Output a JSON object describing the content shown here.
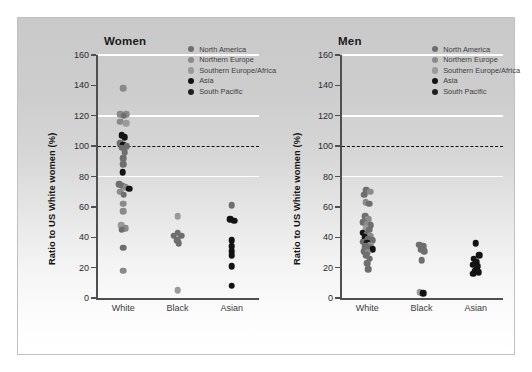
{
  "figure": {
    "background_top": "#c9c9c9",
    "background_bottom": "#ffffff",
    "border_color": "#c0c0c0"
  },
  "legend": {
    "position": "top-right-inside",
    "entries": [
      {
        "label": "North America",
        "color": "#6e6e6e"
      },
      {
        "label": "Northern Europe",
        "color": "#8a8a8a"
      },
      {
        "label": "Southern Europe/Africa",
        "color": "#9a9a9a"
      },
      {
        "label": "Asia",
        "color": "#131313"
      },
      {
        "label": "South Pacific",
        "color": "#1f1f1f"
      }
    ]
  },
  "axis": {
    "ylabel": "Ratio to US White women (%)",
    "yticks": [
      0,
      20,
      40,
      60,
      80,
      100,
      120,
      140,
      160
    ],
    "ylim": [
      0,
      160
    ],
    "gridlines": [
      80,
      120,
      160
    ],
    "reference_line": 100,
    "categories": [
      "White",
      "Black",
      "Asian"
    ]
  },
  "chart_data": {
    "type": "scatter",
    "title": "",
    "xlabel": "",
    "ylabel": "Ratio to US White women (%)",
    "ylim": [
      0,
      160
    ],
    "yticks": [
      0,
      20,
      40,
      60,
      80,
      100,
      120,
      140,
      160
    ],
    "grid": true,
    "gridlines_at": [
      80,
      120,
      160
    ],
    "reference_line": 100,
    "legend_position": "upper right",
    "categories": [
      "White",
      "Black",
      "Asian"
    ],
    "series": [
      {
        "name": "North America",
        "color": "#6e6e6e"
      },
      {
        "name": "Northern Europe",
        "color": "#8a8a8a"
      },
      {
        "name": "Southern Europe/Africa",
        "color": "#9a9a9a"
      },
      {
        "name": "Asia",
        "color": "#131313"
      },
      {
        "name": "South Pacific",
        "color": "#1f1f1f"
      }
    ],
    "panels": [
      {
        "title": "Women",
        "points": [
          {
            "category": "White",
            "value": 138,
            "offset": 0,
            "group": "Northern Europe"
          },
          {
            "category": "White",
            "value": 121,
            "offset": -0.3,
            "group": "Northern Europe"
          },
          {
            "category": "White",
            "value": 121,
            "offset": 0.3,
            "group": "Northern Europe"
          },
          {
            "category": "White",
            "value": 120,
            "offset": 0.04,
            "group": "North America"
          },
          {
            "category": "White",
            "value": 116,
            "offset": -0.26,
            "group": "Northern Europe"
          },
          {
            "category": "White",
            "value": 115,
            "offset": 0.26,
            "group": "Southern Europe/Africa"
          },
          {
            "category": "White",
            "value": 107,
            "offset": -0.12,
            "group": "Asia"
          },
          {
            "category": "White",
            "value": 106,
            "offset": 0.16,
            "group": "Asia"
          },
          {
            "category": "White",
            "value": 102,
            "offset": -0.3,
            "group": "North America"
          },
          {
            "category": "White",
            "value": 101,
            "offset": 0.02,
            "group": "Asia"
          },
          {
            "category": "White",
            "value": 100,
            "offset": 0.32,
            "group": "North America"
          },
          {
            "category": "White",
            "value": 99,
            "offset": -0.14,
            "group": "North America"
          },
          {
            "category": "White",
            "value": 96,
            "offset": 0.14,
            "group": "North America"
          },
          {
            "category": "White",
            "value": 92,
            "offset": 0.0,
            "group": "North America"
          },
          {
            "category": "White",
            "value": 88,
            "offset": 0.0,
            "group": "North America"
          },
          {
            "category": "White",
            "value": 83,
            "offset": -0.04,
            "group": "Asia"
          },
          {
            "category": "White",
            "value": 75,
            "offset": -0.34,
            "group": "North America"
          },
          {
            "category": "White",
            "value": 74,
            "offset": -0.08,
            "group": "North America"
          },
          {
            "category": "White",
            "value": 73,
            "offset": 0.22,
            "group": "Northern Europe"
          },
          {
            "category": "White",
            "value": 72,
            "offset": 0.56,
            "group": "Asia"
          },
          {
            "category": "White",
            "value": 70,
            "offset": -0.3,
            "group": "Northern Europe"
          },
          {
            "category": "White",
            "value": 68,
            "offset": 0.06,
            "group": "North America"
          },
          {
            "category": "White",
            "value": 62,
            "offset": 0.0,
            "group": "Northern Europe"
          },
          {
            "category": "White",
            "value": 57,
            "offset": 0.0,
            "group": "Northern Europe"
          },
          {
            "category": "White",
            "value": 48,
            "offset": -0.16,
            "group": "Southern Europe/Africa"
          },
          {
            "category": "White",
            "value": 46,
            "offset": 0.2,
            "group": "Northern Europe"
          },
          {
            "category": "White",
            "value": 45,
            "offset": -0.12,
            "group": "North America"
          },
          {
            "category": "White",
            "value": 33,
            "offset": 0.0,
            "group": "North America"
          },
          {
            "category": "White",
            "value": 18,
            "offset": 0.0,
            "group": "Northern Europe"
          },
          {
            "category": "Black",
            "value": 54,
            "offset": 0.0,
            "group": "Southern Europe/Africa"
          },
          {
            "category": "Black",
            "value": 43,
            "offset": 0.0,
            "group": "North America"
          },
          {
            "category": "Black",
            "value": 41,
            "offset": -0.34,
            "group": "North America"
          },
          {
            "category": "Black",
            "value": 41,
            "offset": 0.32,
            "group": "North America"
          },
          {
            "category": "Black",
            "value": 38,
            "offset": -0.02,
            "group": "North America"
          },
          {
            "category": "Black",
            "value": 36,
            "offset": 0.1,
            "group": "North America"
          },
          {
            "category": "Black",
            "value": 5,
            "offset": 0.0,
            "group": "Southern Europe/Africa"
          },
          {
            "category": "Asian",
            "value": 61,
            "offset": 0.0,
            "group": "North America"
          },
          {
            "category": "Asian",
            "value": 52,
            "offset": -0.16,
            "group": "Asia"
          },
          {
            "category": "Asian",
            "value": 51,
            "offset": 0.22,
            "group": "Asia"
          },
          {
            "category": "Asian",
            "value": 38,
            "offset": 0.0,
            "group": "Asia"
          },
          {
            "category": "Asian",
            "value": 34,
            "offset": 0.0,
            "group": "Asia"
          },
          {
            "category": "Asian",
            "value": 31,
            "offset": 0.0,
            "group": "Asia"
          },
          {
            "category": "Asian",
            "value": 28,
            "offset": 0.0,
            "group": "Asia"
          },
          {
            "category": "Asian",
            "value": 21,
            "offset": 0.0,
            "group": "Asia"
          },
          {
            "category": "Asian",
            "value": 8,
            "offset": 0.0,
            "group": "Asia"
          }
        ]
      },
      {
        "title": "Men",
        "points": [
          {
            "category": "White",
            "value": 71,
            "offset": -0.1,
            "group": "North America"
          },
          {
            "category": "White",
            "value": 70,
            "offset": 0.26,
            "group": "Northern Europe"
          },
          {
            "category": "White",
            "value": 68,
            "offset": -0.3,
            "group": "North America"
          },
          {
            "category": "White",
            "value": 63,
            "offset": -0.12,
            "group": "Northern Europe"
          },
          {
            "category": "White",
            "value": 62,
            "offset": 0.2,
            "group": "North America"
          },
          {
            "category": "White",
            "value": 54,
            "offset": -0.2,
            "group": "North America"
          },
          {
            "category": "White",
            "value": 52,
            "offset": 0.12,
            "group": "Northern Europe"
          },
          {
            "category": "White",
            "value": 50,
            "offset": -0.34,
            "group": "North America"
          },
          {
            "category": "White",
            "value": 49,
            "offset": 0.02,
            "group": "Northern Europe"
          },
          {
            "category": "White",
            "value": 48,
            "offset": 0.34,
            "group": "North America"
          },
          {
            "category": "White",
            "value": 46,
            "offset": -0.14,
            "group": "Southern Europe/Africa"
          },
          {
            "category": "White",
            "value": 45,
            "offset": 0.18,
            "group": "North America"
          },
          {
            "category": "White",
            "value": 43,
            "offset": -0.4,
            "group": "Asia"
          },
          {
            "category": "White",
            "value": 42,
            "offset": -0.04,
            "group": "North America"
          },
          {
            "category": "White",
            "value": 41,
            "offset": 0.28,
            "group": "Northern Europe"
          },
          {
            "category": "White",
            "value": 40,
            "offset": -0.24,
            "group": "Asia"
          },
          {
            "category": "White",
            "value": 39,
            "offset": 0.08,
            "group": "North America"
          },
          {
            "category": "White",
            "value": 38,
            "offset": 0.44,
            "group": "North America"
          },
          {
            "category": "White",
            "value": 37,
            "offset": -0.36,
            "group": "North America"
          },
          {
            "category": "White",
            "value": 36,
            "offset": 0.0,
            "group": "Asia"
          },
          {
            "category": "White",
            "value": 35,
            "offset": 0.3,
            "group": "Northern Europe"
          },
          {
            "category": "White",
            "value": 34,
            "offset": -0.18,
            "group": "North America"
          },
          {
            "category": "White",
            "value": 33,
            "offset": 0.14,
            "group": "North America"
          },
          {
            "category": "White",
            "value": 32,
            "offset": 0.52,
            "group": "Asia"
          },
          {
            "category": "White",
            "value": 31,
            "offset": -0.3,
            "group": "North America"
          },
          {
            "category": "White",
            "value": 30,
            "offset": 0.04,
            "group": "Northern Europe"
          },
          {
            "category": "White",
            "value": 28,
            "offset": -0.08,
            "group": "North America"
          },
          {
            "category": "White",
            "value": 26,
            "offset": 0.22,
            "group": "North America"
          },
          {
            "category": "White",
            "value": 23,
            "offset": -0.02,
            "group": "North America"
          },
          {
            "category": "White",
            "value": 19,
            "offset": 0.1,
            "group": "North America"
          },
          {
            "category": "Black",
            "value": 35,
            "offset": -0.22,
            "group": "North America"
          },
          {
            "category": "Black",
            "value": 34,
            "offset": 0.14,
            "group": "North America"
          },
          {
            "category": "Black",
            "value": 32,
            "offset": -0.06,
            "group": "North America"
          },
          {
            "category": "Black",
            "value": 31,
            "offset": 0.24,
            "group": "North America"
          },
          {
            "category": "Black",
            "value": 25,
            "offset": 0.0,
            "group": "North America"
          },
          {
            "category": "Black",
            "value": 4,
            "offset": -0.16,
            "group": "Southern Europe/Africa"
          },
          {
            "category": "Black",
            "value": 3,
            "offset": 0.18,
            "group": "Asia"
          },
          {
            "category": "Asian",
            "value": 36,
            "offset": 0.0,
            "group": "Asia"
          },
          {
            "category": "Asian",
            "value": 28,
            "offset": 0.3,
            "group": "Asia"
          },
          {
            "category": "Asian",
            "value": 26,
            "offset": -0.18,
            "group": "Asia"
          },
          {
            "category": "Asian",
            "value": 24,
            "offset": 0.06,
            "group": "Asia"
          },
          {
            "category": "Asian",
            "value": 22,
            "offset": -0.24,
            "group": "Asia"
          },
          {
            "category": "Asian",
            "value": 21,
            "offset": 0.14,
            "group": "Asia"
          },
          {
            "category": "Asian",
            "value": 18,
            "offset": -0.06,
            "group": "Asia"
          },
          {
            "category": "Asian",
            "value": 17,
            "offset": 0.26,
            "group": "Asia"
          },
          {
            "category": "Asian",
            "value": 16,
            "offset": -0.26,
            "group": "Asia"
          }
        ]
      }
    ]
  }
}
